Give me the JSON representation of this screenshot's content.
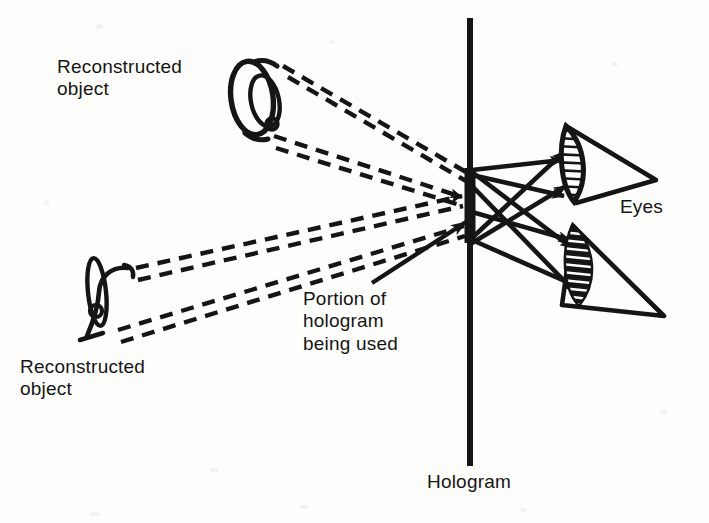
{
  "figure": {
    "width": 709,
    "height": 523,
    "background_color": "#fdfdfb",
    "ink_color": "#151515"
  },
  "labels": {
    "reconstructed_object_upper": "Reconstructed\nobject",
    "reconstructed_object_lower": "Reconstructed\nobject",
    "portion_of_hologram": "Portion of\nhologram\nbeing used",
    "eyes": "Eyes",
    "hologram": "Hologram"
  },
  "elements": {
    "hologram_plane": {
      "name": "Hologram",
      "orientation": "vertical",
      "x": 470,
      "y_top": 18,
      "y_bottom": 466,
      "stroke_width": 6
    },
    "aperture": {
      "name": "Portion of hologram being used",
      "x": 470,
      "y_top": 168,
      "y_bottom": 243,
      "stroke_width": 11
    },
    "objects": [
      {
        "id": "reconstructed-object-upper",
        "label": "Reconstructed object",
        "shape": "ring-and-lens",
        "cx": 252,
        "cy": 97
      },
      {
        "id": "reconstructed-object-lower",
        "label": "Reconstructed object",
        "shape": "ring-edge-on",
        "cx": 92,
        "cy": 298
      }
    ],
    "eyes": [
      {
        "id": "eye-upper",
        "label": "Eyes",
        "apex_x": 655,
        "apex_y": 180,
        "lens_x": 573,
        "lens_y": 163,
        "lens_fill": "white-hatched"
      },
      {
        "id": "eye-lower",
        "label": "Eyes",
        "apex_x": 662,
        "apex_y": 315,
        "lens_x": 578,
        "lens_y": 262,
        "lens_fill": "black-hatched"
      }
    ],
    "virtual_rays": {
      "style": "dashed",
      "description": "Dashed ray bundles run from each reconstructed object to the hologram aperture (virtual-image rays)",
      "bundle_count": 4,
      "rays_per_bundle": 2
    },
    "real_rays": {
      "style": "solid-with-arrowhead",
      "description": "Solid arrows diverge from the hologram aperture and cross in an X pattern on their way to the two eyes",
      "count": 4
    },
    "callout_arrow": {
      "from_x": 372,
      "from_y": 283,
      "to_x": 466,
      "to_y": 224
    }
  }
}
